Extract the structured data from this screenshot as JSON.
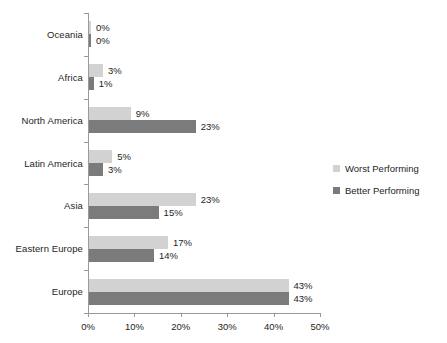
{
  "chart_data": {
    "type": "bar",
    "orientation": "horizontal",
    "title": "",
    "subtitle": "",
    "xlabel": "",
    "ylabel": "",
    "xlim": [
      0,
      50
    ],
    "xticks": [
      0,
      10,
      20,
      30,
      40,
      50
    ],
    "xtick_labels": [
      "0%",
      "10%",
      "20%",
      "30%",
      "40%",
      "50%"
    ],
    "grid": false,
    "legend_position": "right",
    "value_label_suffix": "%",
    "categories": [
      "Oceania",
      "Africa",
      "North America",
      "Latin America",
      "Asia",
      "Eastern Europe",
      "Europe"
    ],
    "series": [
      {
        "name": "Worst Performing",
        "color": "#d2d2d2",
        "values": [
          0,
          3,
          9,
          5,
          23,
          17,
          43
        ],
        "value_labels": [
          "0%",
          "3%",
          "9%",
          "5%",
          "23%",
          "17%",
          "43%"
        ]
      },
      {
        "name": "Better Performing",
        "color": "#7b7b7b",
        "values": [
          0,
          1,
          23,
          3,
          15,
          14,
          43
        ],
        "value_labels": [
          "0%",
          "1%",
          "23%",
          "3%",
          "15%",
          "14%",
          "43%"
        ]
      }
    ]
  },
  "legend": {
    "items": [
      {
        "label": "Worst Performing",
        "color": "#d2d2d2"
      },
      {
        "label": "Better Performing",
        "color": "#7b7b7b"
      }
    ]
  },
  "axis": {
    "line_color": "#9a9a9a"
  }
}
